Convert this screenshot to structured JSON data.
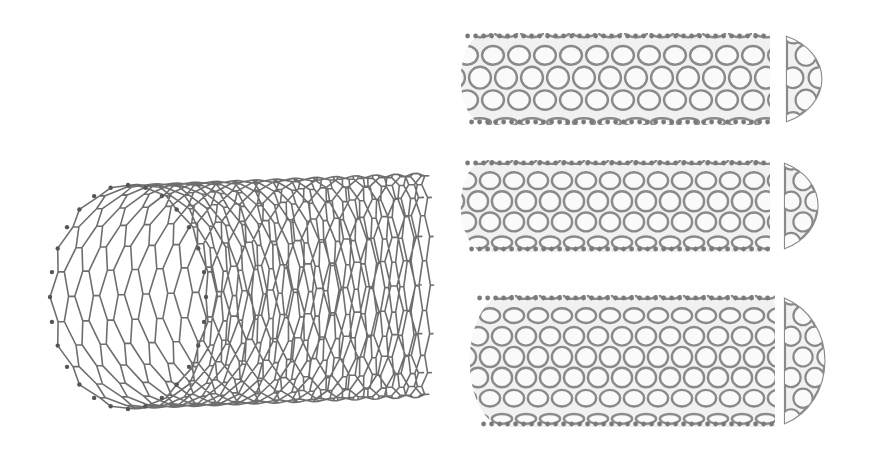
{
  "figure": {
    "subject": "Carbon nanotube structures",
    "colors": {
      "background": "#ffffff",
      "perspective_bond": "#555555",
      "model_bond": "#8a8a8a",
      "model_fill": "#f1f1f1",
      "atom": "#7a7a7a"
    },
    "elements": [
      {
        "id": "perspective-tube",
        "description": "Open-ended single-wall nanotube in perspective, hexagonal lattice"
      },
      {
        "id": "armchair-tube",
        "description": "Capped nanotube model with separated end cap (top)"
      },
      {
        "id": "zigzag-tube",
        "description": "Capped nanotube model with separated end cap (middle)"
      },
      {
        "id": "chiral-tube",
        "description": "Capped nanotube model with separated end cap (bottom)"
      }
    ]
  }
}
